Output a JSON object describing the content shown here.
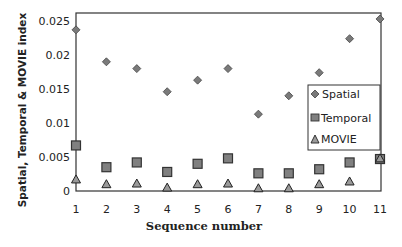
{
  "chart_data": {
    "type": "scatter",
    "title": "",
    "xlabel": "Sequence number",
    "ylabel": "Spatial, Temporal & MOVIE index",
    "x": [
      1,
      2,
      3,
      4,
      5,
      6,
      7,
      8,
      9,
      10,
      11
    ],
    "x_tick_labels": [
      "1",
      "2",
      "3",
      "4",
      "5",
      "6",
      "7",
      "8",
      "9",
      "10",
      "11"
    ],
    "y_tick_labels": [
      "0",
      "0.005",
      "0.01",
      "0.015",
      "0.02",
      "0.025"
    ],
    "y_ticks": [
      0,
      0.005,
      0.01,
      0.015,
      0.02,
      0.025
    ],
    "xlim": [
      1,
      11
    ],
    "ylim": [
      0,
      0.026
    ],
    "grid": false,
    "legend_position": "right-inside",
    "series": [
      {
        "name": "Spatial",
        "marker": "diamond",
        "color": "#7a7a7a",
        "values": [
          0.0237,
          0.019,
          0.018,
          0.0146,
          0.0163,
          0.018,
          0.0113,
          0.014,
          0.0174,
          0.0224,
          0.0253
        ]
      },
      {
        "name": "Temporal",
        "marker": "square",
        "color": "#808080",
        "values": [
          0.0067,
          0.0035,
          0.0042,
          0.0028,
          0.004,
          0.0048,
          0.0026,
          0.0026,
          0.0032,
          0.0042,
          0.0047
        ]
      },
      {
        "name": "MOVIE",
        "marker": "triangle",
        "color": "#9a9a9a",
        "values": [
          0.0017,
          0.001,
          0.0011,
          0.0005,
          0.001,
          0.0011,
          0.0004,
          0.0004,
          0.001,
          0.0014,
          0.0048
        ]
      }
    ]
  },
  "legend": {
    "items": [
      {
        "label": "Spatial"
      },
      {
        "label": "Temporal"
      },
      {
        "label": "MOVIE"
      }
    ]
  },
  "axes": {
    "x_title": "Sequence number",
    "y_title": "Spatial, Temporal & MOVIE index"
  }
}
